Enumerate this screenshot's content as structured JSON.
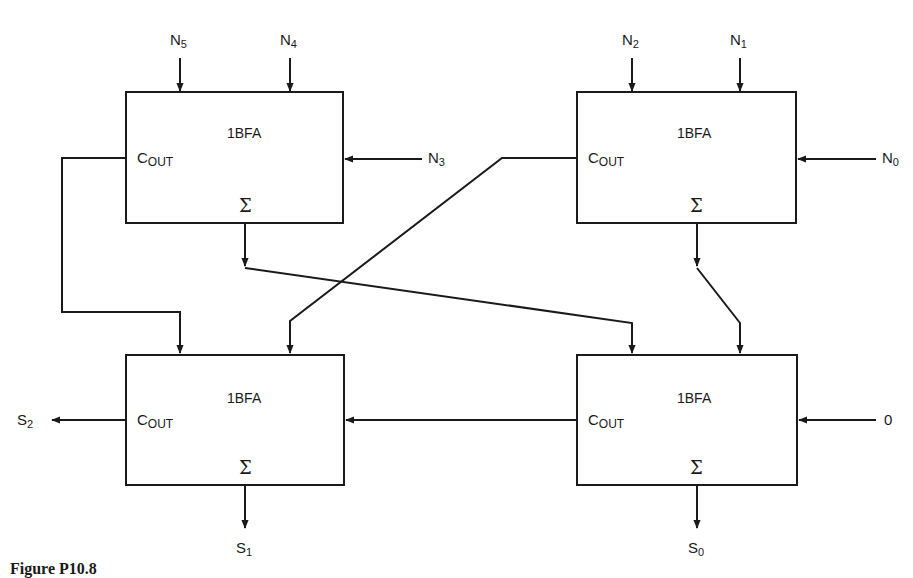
{
  "diagram": {
    "caption": "Figure P10.8",
    "block_label": "1BFA",
    "cout_label_main": "C",
    "cout_label_sub": "OUT",
    "sum_symbol": "Σ",
    "blocks": [
      {
        "id": "top-left",
        "title": "1BFA",
        "inputs_top": [
          "N5",
          "N4"
        ],
        "input_right": "N3"
      },
      {
        "id": "top-right",
        "title": "1BFA",
        "inputs_top": [
          "N2",
          "N1"
        ],
        "input_right": "N0"
      },
      {
        "id": "bottom-left",
        "title": "1BFA",
        "output_left": "S2",
        "output_bottom": "S1"
      },
      {
        "id": "bottom-right",
        "title": "1BFA",
        "input_right": "0",
        "output_bottom": "S0"
      }
    ],
    "labels": {
      "n5": {
        "base": "N",
        "sub": "5"
      },
      "n4": {
        "base": "N",
        "sub": "4"
      },
      "n3": {
        "base": "N",
        "sub": "3"
      },
      "n2": {
        "base": "N",
        "sub": "2"
      },
      "n1": {
        "base": "N",
        "sub": "1"
      },
      "n0": {
        "base": "N",
        "sub": "0"
      },
      "zero": "0",
      "s2": {
        "base": "S",
        "sub": "2"
      },
      "s1": {
        "base": "S",
        "sub": "1"
      },
      "s0": {
        "base": "S",
        "sub": "0"
      }
    },
    "colors": {
      "stroke": "#1a1a1a",
      "background": "#ffffff"
    }
  }
}
